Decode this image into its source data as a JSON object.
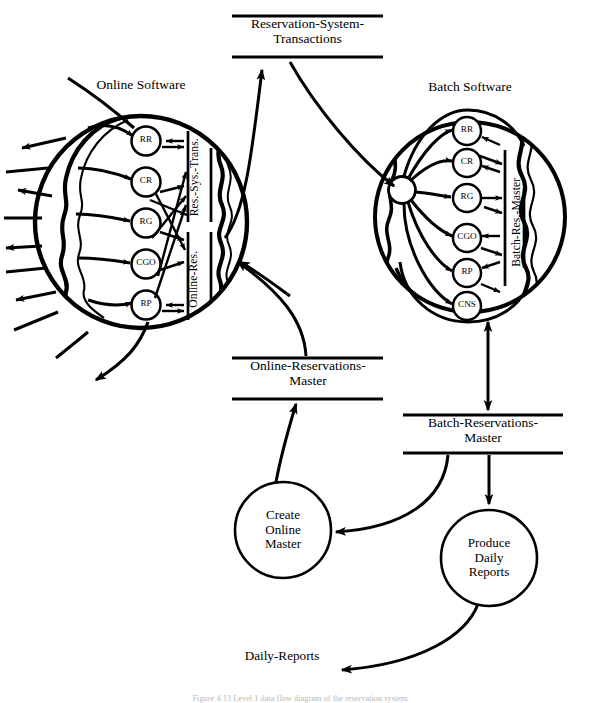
{
  "figure": {
    "type": "data-flow-diagram",
    "caption": "Figure 4.13  Level 1 data flow diagram of the reservation system"
  },
  "data_stores": {
    "reservation_system_transactions": {
      "label": "Reservation-System-\nTransactions",
      "orientation": "horizontal"
    },
    "online_reservations_master": {
      "label": "Online-Reservations-\nMaster",
      "orientation": "horizontal"
    },
    "batch_reservations_master": {
      "label": "Batch-Reservations-\nMaster",
      "orientation": "horizontal"
    },
    "res_sys_trans": {
      "label": "Res.-Sys.-Trans.",
      "orientation": "vertical"
    },
    "online_res": {
      "label": "Online-Res.",
      "orientation": "vertical"
    },
    "batch_res_master": {
      "label": "Batch-Res.-Master",
      "orientation": "vertical"
    }
  },
  "bubbles": {
    "online": {
      "title": "Online Software",
      "nodes": [
        {
          "id": "RR",
          "label": "RR"
        },
        {
          "id": "CR",
          "label": "CR"
        },
        {
          "id": "RG",
          "label": "RG"
        },
        {
          "id": "CGO",
          "label": "CGO"
        },
        {
          "id": "RP",
          "label": "RP"
        }
      ]
    },
    "batch": {
      "title": "Batch Software",
      "hub_label": "",
      "nodes": [
        {
          "id": "RR",
          "label": "RR"
        },
        {
          "id": "CR",
          "label": "CR"
        },
        {
          "id": "RG",
          "label": "RG"
        },
        {
          "id": "CGO",
          "label": "CGO"
        },
        {
          "id": "RP",
          "label": "RP"
        },
        {
          "id": "CNS",
          "label": "CNS"
        }
      ]
    }
  },
  "processes": [
    {
      "id": "create-online-master",
      "label": "Create\nOnline\nMaster"
    },
    {
      "id": "produce-daily-reports",
      "label": "Produce\nDaily\nReports"
    }
  ],
  "flows": [
    {
      "id": "daily-reports",
      "label": "Daily-Reports"
    }
  ],
  "colors": {
    "ink": "#000000",
    "paper": "#ffffff"
  }
}
